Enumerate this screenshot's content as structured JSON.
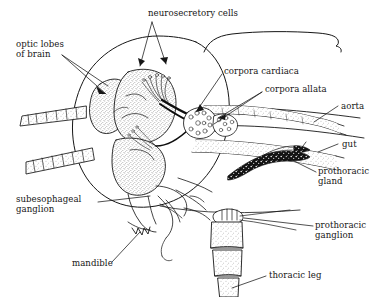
{
  "figure": {
    "background_color": "#ffffff",
    "ink_color": "#161616",
    "width": 378,
    "height": 297
  },
  "labels": {
    "neurosecretory_cells": "neurosecretory cells",
    "optic_lobes_of_brain": "optic lobes\nof brain",
    "corpora_cardiaca": "corpora cardiaca",
    "corpora_allata": "corpora allata",
    "aorta": "aorta",
    "gut": "gut",
    "prothoracic_gland": "prothoracic\ngland",
    "prothoracic_ganglion": "prothoracic\nganglion",
    "thoracic_leg": "thoracic leg",
    "subesophageal_ganglion": "subesophageal\nganglion",
    "mandible": "mandible"
  },
  "structures": {
    "head_capsule": "head-capsule-outline",
    "brain": "brain-stippled",
    "antenna_upper": "antenna-upper-segmented",
    "antenna_lower": "antenna-lower-segmented",
    "brace": "grouping-brace",
    "leg": "thoracic-leg-segmented",
    "gland": "prothoracic-gland-dark"
  }
}
